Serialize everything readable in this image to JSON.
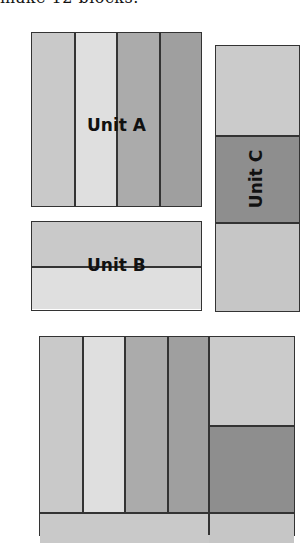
{
  "caption": "make 12 blocks.",
  "colors": {
    "light": "#c9c9c9",
    "lightest": "#dfdfdf",
    "mid": "#ababab",
    "midDark": "#9f9f9f",
    "dark": "#8e8e8e",
    "outline": "#333333"
  },
  "units": {
    "a": {
      "label": "Unit A",
      "strips": [
        "light",
        "lightest",
        "mid",
        "midDark"
      ]
    },
    "b": {
      "label": "Unit B",
      "strips": [
        "light",
        "lightest"
      ]
    },
    "c": {
      "label": "Unit C",
      "sections": [
        "light",
        "dark",
        "light"
      ]
    }
  },
  "assembled_block": {
    "columns": [
      "light",
      "lightest",
      "mid",
      "midDark"
    ],
    "right_column": [
      "light",
      "dark"
    ],
    "bottom_row": [
      "light",
      "light"
    ]
  }
}
